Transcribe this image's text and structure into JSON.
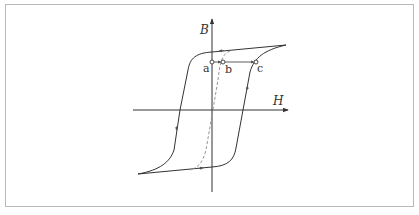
{
  "diagram": {
    "type": "hysteresis-loop",
    "axes": {
      "x_label": "H",
      "y_label": "B"
    },
    "points": [
      {
        "id": "a",
        "label": "a"
      },
      {
        "id": "b",
        "label": "b"
      },
      {
        "id": "c",
        "label": "c"
      }
    ],
    "curves": [
      {
        "name": "major-loop",
        "style": "solid"
      },
      {
        "name": "initial-magnetization-curve",
        "style": "dashed"
      }
    ],
    "colors": {
      "line": "#333333",
      "dashed": "#888888",
      "frame": "#b8b8b8"
    }
  }
}
